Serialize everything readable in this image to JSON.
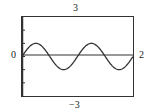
{
  "labels": {
    "ymax": "3",
    "ymin": "−3",
    "xmin": "0",
    "xmax": "2"
  },
  "chart_data": {
    "type": "line",
    "title": "",
    "xlabel": "",
    "ylabel": "",
    "xlim": [
      0,
      2
    ],
    "ylim": [
      -3,
      3
    ],
    "grid": false,
    "legend": null,
    "yticks": [
      -2,
      -1,
      0,
      1,
      2
    ],
    "series": [
      {
        "name": "y = sin(2πx)",
        "x": [
          0,
          0.125,
          0.25,
          0.375,
          0.5,
          0.625,
          0.75,
          0.875,
          1.0,
          1.125,
          1.25,
          1.375,
          1.5,
          1.625,
          1.75,
          1.875,
          2.0
        ],
        "y": [
          0,
          0.707,
          1,
          0.707,
          0,
          -0.707,
          -1,
          -0.707,
          0,
          0.707,
          1,
          0.707,
          0,
          -0.707,
          -1,
          -0.707,
          0
        ]
      }
    ],
    "annotations": [
      "window: Xmin=0, Xmax=2, Ymin=-3, Ymax=3"
    ]
  },
  "colors": {
    "frame": "#333333",
    "curve": "#333333",
    "axis": "#333333"
  }
}
